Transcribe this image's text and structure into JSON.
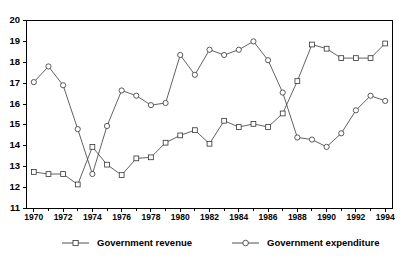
{
  "chart_data": {
    "type": "line",
    "title": "",
    "subtitle": "",
    "xlabel": "",
    "ylabel": "",
    "xlim": [
      1969.5,
      1994.5
    ],
    "ylim": [
      11,
      20
    ],
    "grid": false,
    "legend_position": "bottom",
    "x": [
      1970,
      1971,
      1972,
      1973,
      1974,
      1975,
      1976,
      1977,
      1978,
      1979,
      1980,
      1981,
      1982,
      1983,
      1984,
      1985,
      1986,
      1987,
      1988,
      1989,
      1990,
      1991,
      1992,
      1993,
      1994
    ],
    "x_tick_labels": [
      "1970",
      "1972",
      "1974",
      "1976",
      "1978",
      "1980",
      "1982",
      "1984",
      "1986",
      "1988",
      "1990",
      "1992",
      "1994"
    ],
    "x_tick_values": [
      1970,
      1972,
      1974,
      1976,
      1978,
      1980,
      1982,
      1984,
      1986,
      1988,
      1990,
      1992,
      1994
    ],
    "x_minor_tick_values": [
      1971,
      1973,
      1975,
      1977,
      1979,
      1981,
      1983,
      1985,
      1987,
      1989,
      1991,
      1993
    ],
    "y_tick_labels": [
      "11",
      "12",
      "13",
      "14",
      "15",
      "16",
      "17",
      "18",
      "19",
      "20"
    ],
    "y_tick_values": [
      11,
      12,
      13,
      14,
      15,
      16,
      17,
      18,
      19,
      20
    ],
    "series": [
      {
        "name": "Government revenue",
        "marker": "square",
        "color": "#333333",
        "values": [
          12.75,
          12.65,
          12.65,
          12.15,
          13.95,
          13.1,
          12.6,
          13.4,
          13.45,
          14.15,
          14.5,
          14.75,
          14.1,
          15.2,
          14.9,
          15.05,
          14.9,
          15.55,
          17.1,
          18.85,
          18.65,
          18.2,
          18.2,
          18.2,
          18.9
        ]
      },
      {
        "name": "Government expenditure",
        "marker": "circle",
        "color": "#333333",
        "values": [
          17.05,
          17.8,
          16.9,
          14.8,
          12.65,
          14.95,
          16.65,
          16.4,
          15.95,
          16.05,
          18.35,
          17.4,
          18.6,
          18.35,
          18.6,
          19.0,
          18.1,
          16.55,
          14.4,
          14.3,
          13.95,
          14.6,
          15.7,
          16.4,
          16.15
        ]
      }
    ]
  },
  "legend": {
    "items": [
      {
        "label": "Government revenue",
        "marker": "square"
      },
      {
        "label": "Government expenditure",
        "marker": "circle"
      }
    ]
  }
}
